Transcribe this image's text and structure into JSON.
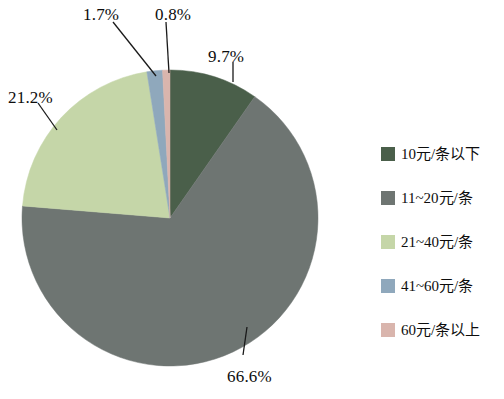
{
  "chart_data": {
    "type": "pie",
    "title": "",
    "subtitle": "",
    "xlabel": "",
    "ylabel": "",
    "legend_position": "right",
    "grid": false,
    "start_angle_deg": 0,
    "direction": "clockwise",
    "units": "percent",
    "categories": [
      "10元/条以下",
      "11~20元/条",
      "21~40元/条",
      "41~60元/条",
      "60元/条以上"
    ],
    "values": [
      9.7,
      66.6,
      21.2,
      1.7,
      0.8
    ],
    "slices": [
      {
        "label": "10元/条以下",
        "value": 9.7,
        "display": "9.7%",
        "color": "#4a5f4a"
      },
      {
        "label": "11~20元/条",
        "value": 66.6,
        "display": "66.6%",
        "color": "#6e7572"
      },
      {
        "label": "21~40元/条",
        "value": 21.2,
        "display": "21.2%",
        "color": "#c5d6a8"
      },
      {
        "label": "41~60元/条",
        "value": 1.7,
        "display": "1.7%",
        "color": "#8fa8bc"
      },
      {
        "label": "60元/条以上",
        "value": 0.8,
        "display": "0.8%",
        "color": "#d9b5ad"
      }
    ]
  },
  "pie": {
    "center_x": 170,
    "center_y": 218,
    "radius": 148,
    "labels": [
      {
        "id": "label-9-7",
        "text": "9.7%",
        "x": 208,
        "y": 47
      },
      {
        "id": "label-66-6",
        "text": "66.6%",
        "x": 227,
        "y": 367
      },
      {
        "id": "label-21-2",
        "text": "21.2%",
        "x": 8,
        "y": 88
      },
      {
        "id": "label-1-7",
        "text": "1.7%",
        "x": 83,
        "y": 5
      },
      {
        "id": "label-0-8",
        "text": "0.8%",
        "x": 155,
        "y": 5
      }
    ],
    "leaders": [
      {
        "id": "leader-9-7",
        "x1": 233,
        "y1": 62,
        "x2": 233,
        "y2": 82
      },
      {
        "id": "leader-66-6",
        "x1": 243,
        "y1": 355,
        "x2": 247,
        "y2": 327
      },
      {
        "id": "leader-21-2",
        "x1": 38,
        "y1": 103,
        "x2": 57,
        "y2": 130
      },
      {
        "id": "leader-1-7",
        "x1": 113,
        "y1": 22,
        "x2": 156,
        "y2": 76
      },
      {
        "id": "leader-0-8",
        "x1": 166,
        "y1": 22,
        "x2": 169,
        "y2": 73
      }
    ]
  },
  "legend": {
    "items": [
      {
        "label": "10元/条以下",
        "color": "#4a5f4a",
        "icon": "legend-swatch-icon"
      },
      {
        "label": "11~20元/条",
        "color": "#6e7572",
        "icon": "legend-swatch-icon"
      },
      {
        "label": "21~40元/条",
        "color": "#c5d6a8",
        "icon": "legend-swatch-icon"
      },
      {
        "label": "41~60元/条",
        "color": "#8fa8bc",
        "icon": "legend-swatch-icon"
      },
      {
        "label": "60元/条以上",
        "color": "#d9b5ad",
        "icon": "legend-swatch-icon"
      }
    ]
  }
}
